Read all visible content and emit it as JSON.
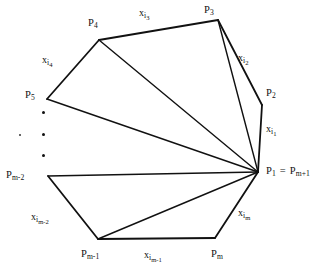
{
  "figure": {
    "stroke_color": "#111111",
    "background_color": "#ffffff",
    "width": 326,
    "height": 280,
    "vertex_labels": {
      "p4": {
        "base": "P",
        "sub": "4"
      },
      "p3": {
        "base": "P",
        "sub": "3"
      },
      "p2": {
        "base": "P",
        "sub": "2"
      },
      "p5": {
        "base": "P",
        "sub": "5"
      },
      "p1": {
        "base": "P",
        "sub": "1",
        "eq": "=",
        "base2": "P",
        "sub2": "m+1"
      },
      "pm_2": {
        "base": "P",
        "sub": "m-2"
      },
      "pm_1": {
        "base": "P",
        "sub": "m-1"
      },
      "pm": {
        "base": "P",
        "sub": "m"
      }
    },
    "edge_labels": {
      "xi3": {
        "base": "x",
        "sub": "i",
        "subsub": "3"
      },
      "xi2": {
        "base": "x",
        "sub": "i",
        "subsub": "2"
      },
      "xi1": {
        "base": "x",
        "sub": "i",
        "subsub": "1"
      },
      "xi4": {
        "base": "x",
        "sub": "i",
        "subsub": "4"
      },
      "xim": {
        "base": "x",
        "sub": "i",
        "subsub": "m"
      },
      "xim_1": {
        "base": "x",
        "sub": "i",
        "subsub": "m-1"
      },
      "xim_2": {
        "base": "x",
        "sub": "i",
        "subsub": "m-2"
      }
    },
    "ellipsis": {
      "description": "vertical dots indicating omitted vertices",
      "count": 3
    }
  },
  "geometry": {
    "vertices": {
      "P1": [
        258,
        172
      ],
      "P2": [
        262,
        105
      ],
      "P3": [
        218,
        20
      ],
      "P4": [
        99,
        40
      ],
      "P5": [
        47,
        99
      ],
      "Pm_2": [
        48,
        176
      ],
      "Pm_1": [
        98,
        239
      ],
      "Pm": [
        215,
        238
      ]
    },
    "hull_edges": [
      [
        "P1",
        "P2"
      ],
      [
        "P2",
        "P3"
      ],
      [
        "P3",
        "P4"
      ],
      [
        "P4",
        "P5"
      ],
      [
        "Pm_2",
        "Pm_1"
      ],
      [
        "Pm_1",
        "Pm"
      ],
      [
        "Pm",
        "P1"
      ]
    ],
    "diagonals": [
      [
        "P1",
        "P3"
      ],
      [
        "P1",
        "P4"
      ],
      [
        "P1",
        "P5"
      ],
      [
        "P1",
        "Pm_2"
      ],
      [
        "P1",
        "Pm_1"
      ]
    ]
  }
}
